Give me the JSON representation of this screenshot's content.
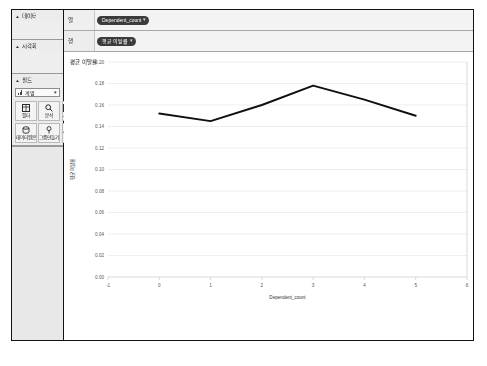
{
  "app": {
    "locale_note": "CJK UI",
    "accent": "#3b3b3b",
    "line_color": "#101010"
  },
  "sidebar": {
    "sections": [
      {
        "title": "데이터",
        "caret": "▲"
      },
      {
        "title": "시각화",
        "caret": "▲"
      },
      {
        "title": "필드",
        "caret": "▲"
      }
    ],
    "field_select": {
      "icon": "bar-chart-icon",
      "value": "계열",
      "caret": "▾"
    },
    "tools": [
      {
        "label": "필터",
        "icon": "table-icon"
      },
      {
        "label": "분석",
        "icon": "magnifier-icon"
      },
      {
        "label": "서식",
        "icon": "layout-icon"
      },
      {
        "label": "데이터원본",
        "icon": "database-icon"
      },
      {
        "label": "그룹만들기",
        "icon": "pin-icon"
      },
      {
        "label": "축",
        "icon": "trend-icon"
      }
    ]
  },
  "shelves": [
    {
      "label": "열",
      "chip": "Dependent_count",
      "chevron": "▾"
    },
    {
      "label": "행",
      "chip": "평균 이탈률",
      "chevron": "▾"
    }
  ],
  "canvas": {
    "title": "평균 이탈률"
  },
  "chart_data": {
    "type": "line",
    "title": "",
    "xlabel": "Dependent_count",
    "ylabel": "평균 이탈률",
    "x": [
      0,
      1,
      2,
      3,
      4,
      5
    ],
    "values": [
      0.152,
      0.145,
      0.16,
      0.178,
      0.165,
      0.15
    ],
    "xticks": [
      -1,
      0,
      1,
      2,
      3,
      4,
      5,
      6
    ],
    "yticks": [
      0.0,
      0.02,
      0.04,
      0.06,
      0.08,
      0.1,
      0.12,
      0.14,
      0.16,
      0.18,
      0.2
    ],
    "ytick_labels": [
      "0.00",
      "0.02",
      "0.04",
      "0.06",
      "0.08",
      "0.10",
      "0.12",
      "0.14",
      "0.16",
      "0.18",
      "0.20"
    ],
    "xlim": [
      -1,
      6
    ],
    "ylim": [
      0.0,
      0.2
    ],
    "grid": true,
    "legend": "none"
  }
}
